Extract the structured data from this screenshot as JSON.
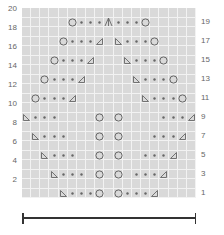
{
  "chart": {
    "cols": 19,
    "rows": 20,
    "grid_color": "#d9d9d9",
    "line_color": "#f2f2f2",
    "symbol_color": "#666666",
    "left_row_labels": [
      "2",
      "4",
      "6",
      "8",
      "10",
      "12",
      "14",
      "16",
      "18",
      "20"
    ],
    "right_row_labels": [
      "1",
      "3",
      "5",
      "7",
      "9",
      "11",
      "13",
      "15",
      "17",
      "19"
    ],
    "legend": {
      "yo": "yarn over (circle)",
      "k": "knit (dot)",
      "ssk": "left-leaning decrease",
      "k2tog": "right-leaning decrease",
      "cdd": "centered double decrease"
    },
    "symbols": [
      {
        "row": 1,
        "col": 5,
        "t": "ssk"
      },
      {
        "row": 1,
        "col": 6,
        "t": "k"
      },
      {
        "row": 1,
        "col": 7,
        "t": "k"
      },
      {
        "row": 1,
        "col": 8,
        "t": "k"
      },
      {
        "row": 1,
        "col": 9,
        "t": "yo"
      },
      {
        "row": 1,
        "col": 11,
        "t": "yo"
      },
      {
        "row": 1,
        "col": 12,
        "t": "k"
      },
      {
        "row": 1,
        "col": 13,
        "t": "k"
      },
      {
        "row": 1,
        "col": 14,
        "t": "k"
      },
      {
        "row": 1,
        "col": 15,
        "t": "k2tog"
      },
      {
        "row": 3,
        "col": 4,
        "t": "ssk"
      },
      {
        "row": 3,
        "col": 5,
        "t": "k"
      },
      {
        "row": 3,
        "col": 6,
        "t": "k"
      },
      {
        "row": 3,
        "col": 7,
        "t": "k"
      },
      {
        "row": 3,
        "col": 9,
        "t": "yo"
      },
      {
        "row": 3,
        "col": 11,
        "t": "yo"
      },
      {
        "row": 3,
        "col": 13,
        "t": "k"
      },
      {
        "row": 3,
        "col": 14,
        "t": "k"
      },
      {
        "row": 3,
        "col": 15,
        "t": "k"
      },
      {
        "row": 3,
        "col": 16,
        "t": "k2tog"
      },
      {
        "row": 5,
        "col": 3,
        "t": "ssk"
      },
      {
        "row": 5,
        "col": 4,
        "t": "k"
      },
      {
        "row": 5,
        "col": 5,
        "t": "k"
      },
      {
        "row": 5,
        "col": 6,
        "t": "k"
      },
      {
        "row": 5,
        "col": 9,
        "t": "yo"
      },
      {
        "row": 5,
        "col": 11,
        "t": "yo"
      },
      {
        "row": 5,
        "col": 14,
        "t": "k"
      },
      {
        "row": 5,
        "col": 15,
        "t": "k"
      },
      {
        "row": 5,
        "col": 16,
        "t": "k"
      },
      {
        "row": 5,
        "col": 17,
        "t": "k2tog"
      },
      {
        "row": 7,
        "col": 2,
        "t": "ssk"
      },
      {
        "row": 7,
        "col": 3,
        "t": "k"
      },
      {
        "row": 7,
        "col": 4,
        "t": "k"
      },
      {
        "row": 7,
        "col": 5,
        "t": "k"
      },
      {
        "row": 7,
        "col": 9,
        "t": "yo"
      },
      {
        "row": 7,
        "col": 11,
        "t": "yo"
      },
      {
        "row": 7,
        "col": 15,
        "t": "k"
      },
      {
        "row": 7,
        "col": 16,
        "t": "k"
      },
      {
        "row": 7,
        "col": 17,
        "t": "k"
      },
      {
        "row": 7,
        "col": 18,
        "t": "k2tog"
      },
      {
        "row": 9,
        "col": 1,
        "t": "ssk"
      },
      {
        "row": 9,
        "col": 2,
        "t": "k"
      },
      {
        "row": 9,
        "col": 3,
        "t": "k"
      },
      {
        "row": 9,
        "col": 4,
        "t": "k"
      },
      {
        "row": 9,
        "col": 9,
        "t": "yo"
      },
      {
        "row": 9,
        "col": 11,
        "t": "yo"
      },
      {
        "row": 9,
        "col": 16,
        "t": "k"
      },
      {
        "row": 9,
        "col": 17,
        "t": "k"
      },
      {
        "row": 9,
        "col": 18,
        "t": "k"
      },
      {
        "row": 9,
        "col": 19,
        "t": "k2tog"
      },
      {
        "row": 11,
        "col": 2,
        "t": "yo"
      },
      {
        "row": 11,
        "col": 3,
        "t": "k"
      },
      {
        "row": 11,
        "col": 4,
        "t": "k"
      },
      {
        "row": 11,
        "col": 5,
        "t": "k"
      },
      {
        "row": 11,
        "col": 6,
        "t": "k2tog"
      },
      {
        "row": 11,
        "col": 14,
        "t": "ssk"
      },
      {
        "row": 11,
        "col": 15,
        "t": "k"
      },
      {
        "row": 11,
        "col": 16,
        "t": "k"
      },
      {
        "row": 11,
        "col": 17,
        "t": "k"
      },
      {
        "row": 11,
        "col": 18,
        "t": "yo"
      },
      {
        "row": 13,
        "col": 3,
        "t": "yo"
      },
      {
        "row": 13,
        "col": 4,
        "t": "k"
      },
      {
        "row": 13,
        "col": 5,
        "t": "k"
      },
      {
        "row": 13,
        "col": 6,
        "t": "k"
      },
      {
        "row": 13,
        "col": 7,
        "t": "k2tog"
      },
      {
        "row": 13,
        "col": 13,
        "t": "ssk"
      },
      {
        "row": 13,
        "col": 14,
        "t": "k"
      },
      {
        "row": 13,
        "col": 15,
        "t": "k"
      },
      {
        "row": 13,
        "col": 16,
        "t": "k"
      },
      {
        "row": 13,
        "col": 17,
        "t": "yo"
      },
      {
        "row": 15,
        "col": 4,
        "t": "yo"
      },
      {
        "row": 15,
        "col": 5,
        "t": "k"
      },
      {
        "row": 15,
        "col": 6,
        "t": "k"
      },
      {
        "row": 15,
        "col": 7,
        "t": "k"
      },
      {
        "row": 15,
        "col": 8,
        "t": "k2tog"
      },
      {
        "row": 15,
        "col": 12,
        "t": "ssk"
      },
      {
        "row": 15,
        "col": 13,
        "t": "k"
      },
      {
        "row": 15,
        "col": 14,
        "t": "k"
      },
      {
        "row": 15,
        "col": 15,
        "t": "k"
      },
      {
        "row": 15,
        "col": 16,
        "t": "yo"
      },
      {
        "row": 17,
        "col": 5,
        "t": "yo"
      },
      {
        "row": 17,
        "col": 6,
        "t": "k"
      },
      {
        "row": 17,
        "col": 7,
        "t": "k"
      },
      {
        "row": 17,
        "col": 8,
        "t": "k"
      },
      {
        "row": 17,
        "col": 9,
        "t": "k2tog"
      },
      {
        "row": 17,
        "col": 11,
        "t": "ssk"
      },
      {
        "row": 17,
        "col": 12,
        "t": "k"
      },
      {
        "row": 17,
        "col": 13,
        "t": "k"
      },
      {
        "row": 17,
        "col": 14,
        "t": "k"
      },
      {
        "row": 17,
        "col": 15,
        "t": "yo"
      },
      {
        "row": 19,
        "col": 6,
        "t": "yo"
      },
      {
        "row": 19,
        "col": 7,
        "t": "k"
      },
      {
        "row": 19,
        "col": 8,
        "t": "k"
      },
      {
        "row": 19,
        "col": 9,
        "t": "k"
      },
      {
        "row": 19,
        "col": 10,
        "t": "cdd"
      },
      {
        "row": 19,
        "col": 11,
        "t": "k"
      },
      {
        "row": 19,
        "col": 12,
        "t": "k"
      },
      {
        "row": 19,
        "col": 13,
        "t": "k"
      },
      {
        "row": 19,
        "col": 14,
        "t": "yo"
      }
    ]
  },
  "scale_bar": {
    "label": ""
  }
}
